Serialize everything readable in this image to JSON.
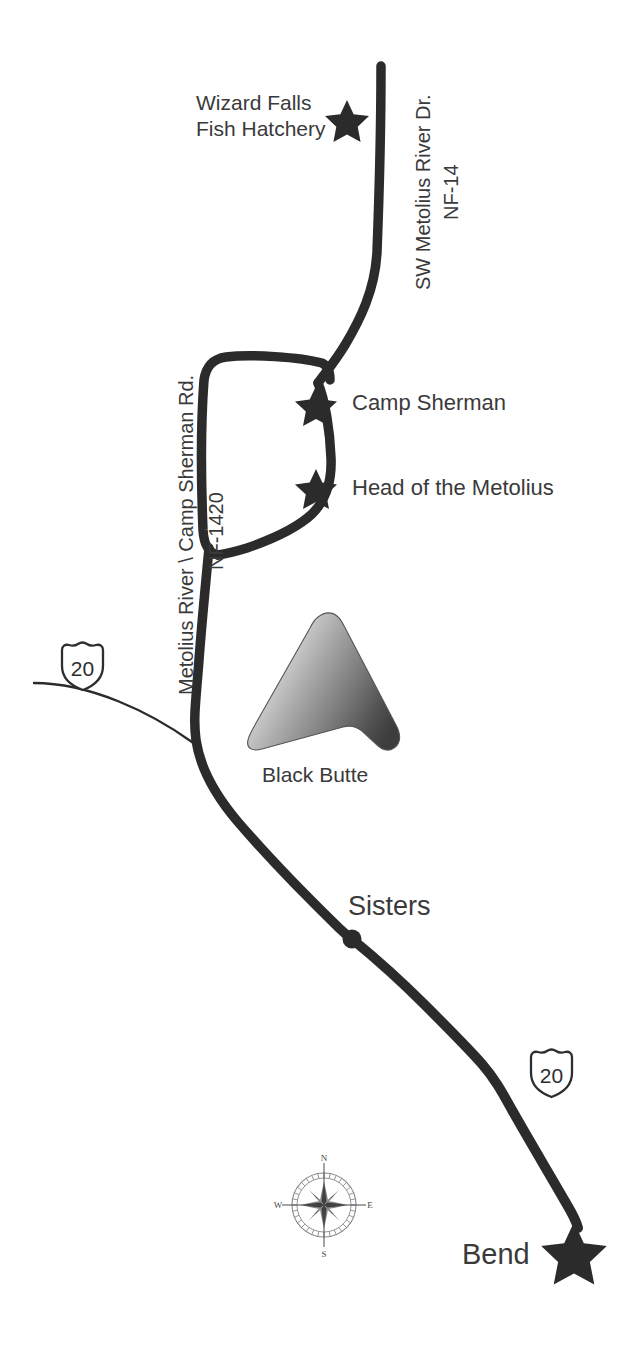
{
  "map": {
    "title": "Metolius River / Camp Sherman Area Map",
    "background_color": "#ffffff",
    "ink_color": "#2b2b2b",
    "text_color": "#3a3a3a",
    "labels": {
      "wizard_falls_line1": "Wizard Falls",
      "wizard_falls_line2": "Fish Hatchery",
      "camp_sherman": "Camp Sherman",
      "head_of_the_metolius": "Head of the Metolius",
      "black_butte": "Black Butte",
      "sisters": "Sisters",
      "bend": "Bend"
    },
    "roads": {
      "nf14_name": "SW Metolius River Dr.",
      "nf14_number": "NF-14",
      "nf1420_name": "Metolius River \\ Camp Sherman Rd.",
      "nf1420_number": "NF-1420",
      "us20_shield_upper": "20",
      "us20_shield_lower": "20"
    },
    "compass": {
      "north": "N",
      "south": "S",
      "east": "E",
      "west": "W"
    },
    "markers": [
      {
        "name": "wizard-falls-fish-hatchery",
        "type": "star"
      },
      {
        "name": "camp-sherman",
        "type": "star"
      },
      {
        "name": "head-of-the-metolius",
        "type": "star"
      },
      {
        "name": "sisters",
        "type": "dot"
      },
      {
        "name": "bend",
        "type": "star"
      }
    ],
    "terrain": {
      "black_butte": {
        "type": "cone",
        "gradient_from": "#f2f2f2",
        "gradient_to": "#4a4a4a"
      }
    }
  }
}
